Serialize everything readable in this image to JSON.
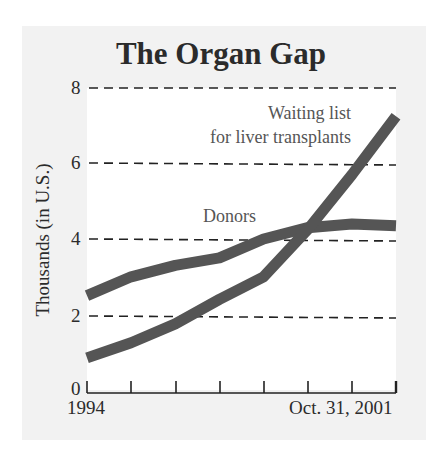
{
  "chart_data": {
    "type": "line",
    "title": "The Organ Gap",
    "xlabel": "",
    "ylabel": "Thousands (in U.S.)",
    "x_tick_labels": [
      "1994",
      "Oct. 31, 2001"
    ],
    "x": [
      0,
      1,
      2,
      3,
      4,
      5,
      6,
      7
    ],
    "y_ticks": [
      0,
      2,
      4,
      6,
      8
    ],
    "ylim": [
      0,
      8
    ],
    "grid": "horizontal dashed at 2, 4, 6, 8",
    "legend": "inline labels",
    "series": [
      {
        "name": "Donors",
        "values": [
          2.5,
          3.0,
          3.3,
          3.5,
          4.0,
          4.3,
          4.4,
          4.35
        ],
        "color": "#555555"
      },
      {
        "name": "Waiting list for liver transplants",
        "values": [
          0.85,
          1.25,
          1.75,
          2.4,
          3.0,
          4.25,
          5.7,
          7.25
        ],
        "color": "#555555"
      }
    ],
    "annotations": [
      {
        "text": "Waiting list",
        "series": "Waiting list for liver transplants"
      },
      {
        "text": "for liver transplants",
        "series": "Waiting list for liver transplants"
      },
      {
        "text": "Donors",
        "series": "Donors"
      }
    ]
  },
  "labels": {
    "title": "The Organ Gap",
    "ylabel": "Thousands (in U.S.)",
    "y0": "0",
    "y2": "2",
    "y4": "4",
    "y6": "6",
    "y8": "8",
    "x_start": "1994",
    "x_end": "Oct. 31, 2001",
    "waiting_line1": "Waiting list",
    "waiting_line2": "for liver transplants",
    "donors": "Donors"
  },
  "colors": {
    "line": "#555555",
    "panel": "#f2f2f2",
    "plot": "#ffffff",
    "text": "#2b2b2b"
  }
}
